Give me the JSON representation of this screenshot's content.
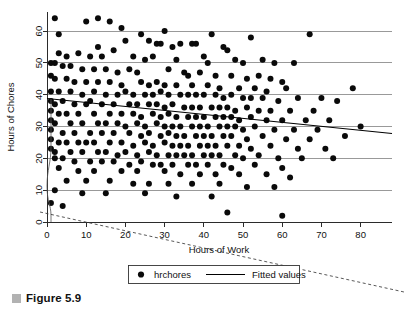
{
  "caption": {
    "marker_color": "#b2b2b2",
    "text": "Figure 5.9"
  },
  "legend": {
    "items": [
      {
        "label": "hrchores",
        "marker": "filled-circle"
      },
      {
        "label": "Fitted values",
        "marker": "line"
      }
    ]
  },
  "chart_data": {
    "type": "scatter",
    "title": "",
    "xlabel": "Hours of Work",
    "ylabel": "Hours of Chores",
    "xlim": [
      0,
      88
    ],
    "ylim": [
      0,
      66
    ],
    "xticks": [
      0,
      10,
      20,
      30,
      40,
      50,
      60,
      70,
      80
    ],
    "yticks": [
      0,
      10,
      20,
      30,
      40,
      50,
      60
    ],
    "xticklabels": [
      "0",
      "10",
      "20",
      "30",
      "40",
      "50",
      "60",
      "70",
      "80"
    ],
    "yticklabels": [
      "0",
      "10",
      "20",
      "30",
      "40",
      "50",
      "60"
    ],
    "grid": "horizontal",
    "legend_position": "below-axis",
    "series": [
      {
        "name": "hrchores",
        "type": "scatter",
        "marker": "filled-circle",
        "color": "#0a0a0a",
        "points": [
          [
            2,
            64
          ],
          [
            10,
            63
          ],
          [
            13,
            64
          ],
          [
            16,
            63
          ],
          [
            3,
            59
          ],
          [
            19,
            61
          ],
          [
            24,
            59
          ],
          [
            30,
            60
          ],
          [
            42,
            59
          ],
          [
            52,
            58
          ],
          [
            67,
            59
          ],
          [
            20,
            57
          ],
          [
            26,
            57
          ],
          [
            28,
            56
          ],
          [
            29,
            56
          ],
          [
            32,
            55
          ],
          [
            34,
            56
          ],
          [
            37,
            56
          ],
          [
            38,
            56
          ],
          [
            45,
            55
          ],
          [
            46,
            54
          ],
          [
            13,
            55
          ],
          [
            17,
            54
          ],
          [
            3,
            53
          ],
          [
            5,
            52
          ],
          [
            8,
            53
          ],
          [
            11,
            52
          ],
          [
            14,
            52
          ],
          [
            22,
            52
          ],
          [
            25,
            51
          ],
          [
            27,
            52
          ],
          [
            33,
            51
          ],
          [
            40,
            52
          ],
          [
            41,
            50
          ],
          [
            48,
            51
          ],
          [
            50,
            50
          ],
          [
            55,
            51
          ],
          [
            58,
            50
          ],
          [
            63,
            50
          ],
          [
            1,
            50
          ],
          [
            2,
            50
          ],
          [
            4,
            49
          ],
          [
            6,
            49
          ],
          [
            9,
            48
          ],
          [
            12,
            48
          ],
          [
            15,
            48
          ],
          [
            18,
            47
          ],
          [
            21,
            48
          ],
          [
            23,
            47
          ],
          [
            31,
            48
          ],
          [
            35,
            47
          ],
          [
            36,
            46
          ],
          [
            39,
            47
          ],
          [
            43,
            46
          ],
          [
            47,
            46
          ],
          [
            51,
            45
          ],
          [
            54,
            46
          ],
          [
            57,
            45
          ],
          [
            60,
            44
          ],
          [
            1,
            46
          ],
          [
            2,
            45
          ],
          [
            5,
            45
          ],
          [
            7,
            44
          ],
          [
            10,
            44
          ],
          [
            13,
            44
          ],
          [
            16,
            44
          ],
          [
            19,
            43
          ],
          [
            24,
            44
          ],
          [
            26,
            43
          ],
          [
            28,
            44
          ],
          [
            30,
            43
          ],
          [
            33,
            43
          ],
          [
            37,
            43
          ],
          [
            41,
            43
          ],
          [
            44,
            42
          ],
          [
            49,
            42
          ],
          [
            53,
            42
          ],
          [
            56,
            41
          ],
          [
            61,
            42
          ],
          [
            78,
            42
          ],
          [
            1,
            41
          ],
          [
            3,
            41
          ],
          [
            6,
            41
          ],
          [
            9,
            40
          ],
          [
            12,
            41
          ],
          [
            15,
            40
          ],
          [
            18,
            40
          ],
          [
            20,
            41
          ],
          [
            22,
            40
          ],
          [
            25,
            40
          ],
          [
            27,
            40
          ],
          [
            29,
            41
          ],
          [
            31,
            40
          ],
          [
            34,
            40
          ],
          [
            36,
            40
          ],
          [
            38,
            40
          ],
          [
            40,
            40
          ],
          [
            43,
            40
          ],
          [
            45,
            39
          ],
          [
            47,
            40
          ],
          [
            50,
            39
          ],
          [
            52,
            39
          ],
          [
            55,
            39
          ],
          [
            59,
            38
          ],
          [
            64,
            39
          ],
          [
            70,
            39
          ],
          [
            74,
            38
          ],
          [
            1,
            38
          ],
          [
            2,
            37
          ],
          [
            4,
            38
          ],
          [
            7,
            37
          ],
          [
            10,
            37
          ],
          [
            11,
            38
          ],
          [
            14,
            37
          ],
          [
            17,
            37
          ],
          [
            21,
            37
          ],
          [
            23,
            37
          ],
          [
            26,
            37
          ],
          [
            28,
            37
          ],
          [
            30,
            36
          ],
          [
            32,
            37
          ],
          [
            35,
            36
          ],
          [
            37,
            36
          ],
          [
            39,
            36
          ],
          [
            42,
            36
          ],
          [
            44,
            36
          ],
          [
            46,
            36
          ],
          [
            48,
            35
          ],
          [
            51,
            36
          ],
          [
            54,
            35
          ],
          [
            57,
            35
          ],
          [
            62,
            35
          ],
          [
            68,
            35
          ],
          [
            1,
            35
          ],
          [
            3,
            34
          ],
          [
            5,
            34
          ],
          [
            8,
            34
          ],
          [
            12,
            34
          ],
          [
            16,
            34
          ],
          [
            19,
            34
          ],
          [
            22,
            34
          ],
          [
            24,
            33
          ],
          [
            27,
            34
          ],
          [
            29,
            33
          ],
          [
            31,
            34
          ],
          [
            33,
            33
          ],
          [
            36,
            33
          ],
          [
            38,
            33
          ],
          [
            40,
            33
          ],
          [
            43,
            33
          ],
          [
            45,
            33
          ],
          [
            47,
            33
          ],
          [
            49,
            32
          ],
          [
            52,
            33
          ],
          [
            56,
            32
          ],
          [
            60,
            32
          ],
          [
            66,
            32
          ],
          [
            72,
            32
          ],
          [
            1,
            32
          ],
          [
            2,
            31
          ],
          [
            6,
            31
          ],
          [
            9,
            31
          ],
          [
            13,
            31
          ],
          [
            15,
            31
          ],
          [
            18,
            31
          ],
          [
            20,
            30
          ],
          [
            23,
            31
          ],
          [
            25,
            30
          ],
          [
            28,
            31
          ],
          [
            30,
            30
          ],
          [
            32,
            30
          ],
          [
            34,
            30
          ],
          [
            37,
            30
          ],
          [
            39,
            30
          ],
          [
            41,
            30
          ],
          [
            44,
            30
          ],
          [
            46,
            30
          ],
          [
            48,
            30
          ],
          [
            50,
            29
          ],
          [
            53,
            30
          ],
          [
            58,
            29
          ],
          [
            63,
            29
          ],
          [
            69,
            29
          ],
          [
            80,
            30
          ],
          [
            1,
            29
          ],
          [
            4,
            28
          ],
          [
            7,
            28
          ],
          [
            11,
            28
          ],
          [
            14,
            28
          ],
          [
            17,
            28
          ],
          [
            21,
            28
          ],
          [
            24,
            27
          ],
          [
            26,
            28
          ],
          [
            29,
            27
          ],
          [
            31,
            28
          ],
          [
            33,
            27
          ],
          [
            35,
            27
          ],
          [
            38,
            27
          ],
          [
            40,
            27
          ],
          [
            42,
            27
          ],
          [
            45,
            27
          ],
          [
            47,
            27
          ],
          [
            51,
            26
          ],
          [
            55,
            27
          ],
          [
            61,
            26
          ],
          [
            67,
            26
          ],
          [
            76,
            27
          ],
          [
            1,
            26
          ],
          [
            3,
            25
          ],
          [
            5,
            25
          ],
          [
            8,
            25
          ],
          [
            10,
            25
          ],
          [
            12,
            25
          ],
          [
            16,
            25
          ],
          [
            19,
            25
          ],
          [
            22,
            24
          ],
          [
            25,
            25
          ],
          [
            27,
            24
          ],
          [
            30,
            25
          ],
          [
            32,
            24
          ],
          [
            34,
            24
          ],
          [
            36,
            24
          ],
          [
            39,
            24
          ],
          [
            41,
            24
          ],
          [
            43,
            24
          ],
          [
            46,
            24
          ],
          [
            49,
            24
          ],
          [
            52,
            23
          ],
          [
            57,
            24
          ],
          [
            64,
            23
          ],
          [
            71,
            23
          ],
          [
            1,
            23
          ],
          [
            2,
            22
          ],
          [
            6,
            22
          ],
          [
            9,
            22
          ],
          [
            13,
            22
          ],
          [
            15,
            22
          ],
          [
            18,
            21
          ],
          [
            20,
            22
          ],
          [
            23,
            21
          ],
          [
            26,
            22
          ],
          [
            28,
            21
          ],
          [
            31,
            21
          ],
          [
            33,
            21
          ],
          [
            35,
            21
          ],
          [
            37,
            21
          ],
          [
            40,
            21
          ],
          [
            42,
            21
          ],
          [
            44,
            21
          ],
          [
            48,
            21
          ],
          [
            50,
            20
          ],
          [
            54,
            21
          ],
          [
            59,
            20
          ],
          [
            65,
            20
          ],
          [
            73,
            20
          ],
          [
            2,
            20
          ],
          [
            4,
            20
          ],
          [
            7,
            19
          ],
          [
            11,
            19
          ],
          [
            14,
            19
          ],
          [
            17,
            19
          ],
          [
            21,
            18
          ],
          [
            24,
            19
          ],
          [
            27,
            18
          ],
          [
            29,
            18
          ],
          [
            32,
            18
          ],
          [
            36,
            18
          ],
          [
            38,
            18
          ],
          [
            41,
            18
          ],
          [
            45,
            18
          ],
          [
            47,
            17
          ],
          [
            53,
            18
          ],
          [
            60,
            17
          ],
          [
            3,
            17
          ],
          [
            8,
            16
          ],
          [
            12,
            16
          ],
          [
            19,
            16
          ],
          [
            23,
            16
          ],
          [
            30,
            16
          ],
          [
            34,
            15
          ],
          [
            39,
            15
          ],
          [
            43,
            15
          ],
          [
            49,
            15
          ],
          [
            56,
            15
          ],
          [
            62,
            14
          ],
          [
            5,
            13
          ],
          [
            10,
            13
          ],
          [
            16,
            13
          ],
          [
            22,
            12
          ],
          [
            26,
            12
          ],
          [
            31,
            12
          ],
          [
            37,
            12
          ],
          [
            44,
            12
          ],
          [
            51,
            11
          ],
          [
            58,
            11
          ],
          [
            2,
            10
          ],
          [
            9,
            9
          ],
          [
            15,
            9
          ],
          [
            25,
            9
          ],
          [
            33,
            8
          ],
          [
            42,
            8
          ],
          [
            1,
            6
          ],
          [
            4,
            5
          ],
          [
            46,
            3
          ],
          [
            60,
            2
          ]
        ]
      },
      {
        "name": "Fitted values",
        "type": "line",
        "color": "#000000",
        "x": [
          0,
          88
        ],
        "y": [
          38.8,
          27.8
        ],
        "slope": -0.125,
        "intercept": 38.8
      }
    ],
    "annotations": [
      {
        "name": "dashed-guide-line",
        "type": "dashed-line",
        "style": "dashed",
        "color": "#3a3a3a"
      },
      {
        "name": "stray-curve-artifact",
        "type": "curve",
        "style": "solid-thin",
        "color": "#555555"
      }
    ]
  }
}
